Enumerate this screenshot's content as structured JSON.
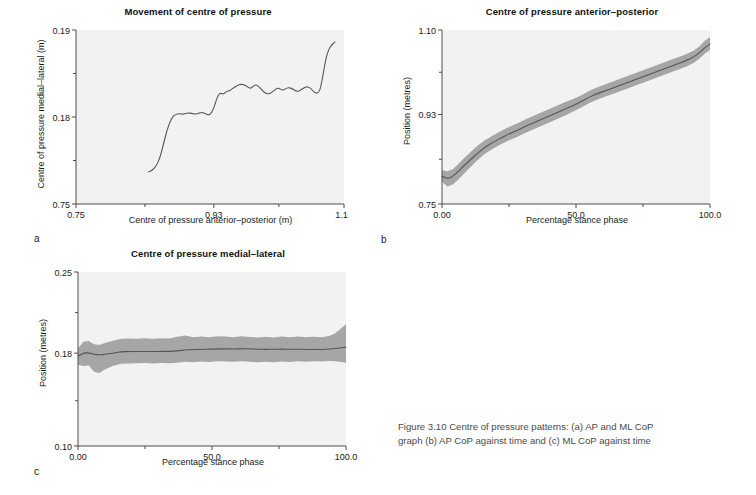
{
  "figure": {
    "caption_line1": "Figure 3.10    Centre of pressure patterns: (a) AP and ML CoP",
    "caption_line2": "graph (b) AP CoP against time and (c) ML CoP against time",
    "letters": {
      "a": "a",
      "b": "b",
      "c": "c"
    },
    "colors": {
      "plot_background": "#f2f2f2",
      "axis": "#4d4d4d",
      "line": "#555555",
      "band": "#a6a6a6",
      "text": "#1a1a1a",
      "caption_text": "#4a4a4a"
    }
  },
  "chart_data": [
    {
      "panel": "a",
      "type": "line",
      "title": "Movement of centre of pressure",
      "xlabel": "Centre of pressure anterior–posterior (m)",
      "ylabel": "Centre of pressure medial–lateral (m)",
      "xlim": [
        0.75,
        1.1
      ],
      "ylim": [
        0.17,
        0.19
      ],
      "xticks": [
        0.75,
        0.93,
        1.1
      ],
      "xticklabels": [
        "0.75",
        "0.93",
        "1.10"
      ],
      "yticks": [
        0.17,
        0.18,
        0.19
      ],
      "yticklabels": [
        "0.75",
        "0.18",
        "0.19"
      ],
      "minor_xticks": [
        0.84,
        1.015
      ],
      "minor_yticks": [
        0.175,
        0.185
      ],
      "grid": false,
      "legend": "none",
      "x": [
        0.845,
        0.85,
        0.855,
        0.86,
        0.864,
        0.868,
        0.872,
        0.876,
        0.88,
        0.885,
        0.89,
        0.896,
        0.902,
        0.908,
        0.914,
        0.92,
        0.925,
        0.93,
        0.934,
        0.938,
        0.942,
        0.946,
        0.95,
        0.955,
        0.96,
        0.966,
        0.972,
        0.978,
        0.984,
        0.99,
        0.996,
        1.002,
        1.008,
        1.014,
        1.02,
        1.026,
        1.032,
        1.038,
        1.044,
        1.05,
        1.056,
        1.062,
        1.068,
        1.072,
        1.076,
        1.08,
        1.084,
        1.088
      ],
      "y": [
        0.1737,
        0.1739,
        0.1744,
        0.1754,
        0.1768,
        0.1782,
        0.1793,
        0.18,
        0.1803,
        0.1804,
        0.1803,
        0.1805,
        0.1804,
        0.1803,
        0.1806,
        0.1803,
        0.1802,
        0.181,
        0.1822,
        0.1828,
        0.1826,
        0.1829,
        0.183,
        0.1833,
        0.1836,
        0.1838,
        0.1836,
        0.1832,
        0.1838,
        0.1834,
        0.1828,
        0.1826,
        0.183,
        0.1834,
        0.183,
        0.1834,
        0.1833,
        0.1829,
        0.1831,
        0.1835,
        0.1834,
        0.1827,
        0.1828,
        0.1845,
        0.1866,
        0.1878,
        0.1883,
        0.1886
      ]
    },
    {
      "panel": "b",
      "type": "line",
      "title": "Centre of pressure anterior–posterior",
      "xlabel": "Percentage stance phase",
      "ylabel": "Position (metres)",
      "xlim": [
        0.0,
        100.0
      ],
      "ylim": [
        0.75,
        1.1
      ],
      "xticks": [
        0.0,
        50.0,
        100.0
      ],
      "xticklabels": [
        "0.00",
        "50.0",
        "100.0"
      ],
      "yticks": [
        0.75,
        0.93,
        1.1
      ],
      "yticklabels": [
        "0.75",
        "0.93",
        "1.10"
      ],
      "minor_xticks": [
        25.0,
        75.0
      ],
      "minor_yticks": [
        0.84,
        1.015
      ],
      "grid": false,
      "legend": "none",
      "band_label": "mean ± 1 SD",
      "x": [
        0,
        2,
        4,
        6,
        8,
        10,
        13,
        16,
        19,
        22,
        25,
        28,
        31,
        34,
        37,
        40,
        43,
        46,
        49,
        52,
        55,
        58,
        61,
        64,
        67,
        70,
        73,
        76,
        79,
        82,
        85,
        88,
        91,
        94,
        96,
        98,
        100
      ],
      "mean": [
        0.806,
        0.801,
        0.805,
        0.815,
        0.826,
        0.836,
        0.851,
        0.864,
        0.874,
        0.883,
        0.891,
        0.898,
        0.906,
        0.913,
        0.92,
        0.927,
        0.934,
        0.941,
        0.948,
        0.956,
        0.965,
        0.972,
        0.978,
        0.984,
        0.99,
        0.996,
        1.002,
        1.008,
        1.014,
        1.02,
        1.026,
        1.032,
        1.038,
        1.046,
        1.054,
        1.064,
        1.072
      ],
      "lower": [
        0.795,
        0.785,
        0.789,
        0.799,
        0.81,
        0.821,
        0.837,
        0.851,
        0.861,
        0.87,
        0.878,
        0.885,
        0.893,
        0.9,
        0.907,
        0.914,
        0.921,
        0.928,
        0.936,
        0.944,
        0.953,
        0.96,
        0.966,
        0.972,
        0.978,
        0.984,
        0.99,
        0.996,
        1.002,
        1.008,
        1.014,
        1.02,
        1.026,
        1.034,
        1.042,
        1.052,
        1.06
      ],
      "upper": [
        0.818,
        0.816,
        0.82,
        0.83,
        0.841,
        0.851,
        0.866,
        0.878,
        0.888,
        0.897,
        0.905,
        0.912,
        0.92,
        0.927,
        0.934,
        0.941,
        0.948,
        0.955,
        0.961,
        0.969,
        0.978,
        0.985,
        0.991,
        0.997,
        1.003,
        1.009,
        1.015,
        1.021,
        1.027,
        1.033,
        1.039,
        1.045,
        1.051,
        1.059,
        1.067,
        1.078,
        1.086
      ]
    },
    {
      "panel": "c",
      "type": "line",
      "title": "Centre of pressure medial–lateral",
      "xlabel": "Percentage stance phase",
      "ylabel": "Position (metres)",
      "xlim": [
        0.0,
        100.0
      ],
      "ylim": [
        0.1,
        0.25
      ],
      "xticks": [
        0.0,
        50.0,
        100.0
      ],
      "xticklabels": [
        "0.00",
        "50.0",
        "100.0"
      ],
      "yticks": [
        0.1,
        0.18,
        0.25
      ],
      "yticklabels": [
        "0.10",
        "0.18",
        "0.25"
      ],
      "minor_xticks": [
        25.0,
        75.0
      ],
      "minor_yticks": [
        0.139,
        0.215
      ],
      "grid": false,
      "legend": "none",
      "band_label": "mean ± 1 SD",
      "x": [
        0,
        2,
        4,
        6,
        8,
        10,
        13,
        16,
        19,
        22,
        25,
        28,
        31,
        34,
        37,
        40,
        43,
        46,
        49,
        52,
        55,
        58,
        61,
        64,
        67,
        70,
        73,
        76,
        79,
        82,
        85,
        88,
        91,
        94,
        96,
        98,
        100
      ],
      "mean": [
        0.1775,
        0.18,
        0.1805,
        0.179,
        0.1785,
        0.179,
        0.18,
        0.1812,
        0.1815,
        0.1815,
        0.1815,
        0.1814,
        0.1815,
        0.1816,
        0.182,
        0.1828,
        0.1832,
        0.1833,
        0.1834,
        0.1836,
        0.1838,
        0.1836,
        0.1838,
        0.1838,
        0.1834,
        0.1833,
        0.1834,
        0.1835,
        0.1834,
        0.1834,
        0.1833,
        0.1832,
        0.1833,
        0.1836,
        0.184,
        0.1846,
        0.1852
      ],
      "lower": [
        0.17,
        0.169,
        0.1695,
        0.164,
        0.163,
        0.166,
        0.169,
        0.171,
        0.1712,
        0.1714,
        0.1716,
        0.1712,
        0.1716,
        0.1714,
        0.1718,
        0.1726,
        0.1722,
        0.1728,
        0.1724,
        0.173,
        0.1728,
        0.1726,
        0.173,
        0.1726,
        0.1722,
        0.1726,
        0.1722,
        0.1728,
        0.1724,
        0.173,
        0.1726,
        0.173,
        0.1728,
        0.1732,
        0.173,
        0.1724,
        0.1718
      ],
      "upper": [
        0.184,
        0.1898,
        0.1905,
        0.1878,
        0.187,
        0.1888,
        0.1908,
        0.1924,
        0.1926,
        0.1924,
        0.1928,
        0.1924,
        0.1928,
        0.1926,
        0.1942,
        0.1952,
        0.1938,
        0.1944,
        0.1938,
        0.1946,
        0.1944,
        0.1938,
        0.1946,
        0.194,
        0.1936,
        0.1942,
        0.1936,
        0.1944,
        0.1938,
        0.1944,
        0.1938,
        0.1942,
        0.1938,
        0.195,
        0.1972,
        0.201,
        0.205
      ]
    }
  ]
}
